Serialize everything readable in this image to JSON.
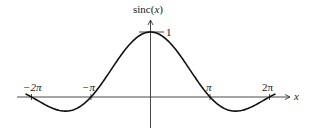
{
  "chart_data": {
    "type": "line",
    "title": "",
    "xlabel": "x",
    "ylabel": "sinc(x)",
    "function": "sin(x)/x",
    "xlim": [
      -6.8,
      6.8
    ],
    "ylim": [
      -0.45,
      1.2
    ],
    "grid": false,
    "legend": null,
    "x_ticks": [
      {
        "value": -6.2832,
        "label": "−2π"
      },
      {
        "value": -3.1416,
        "label": "−π"
      },
      {
        "value": 3.1416,
        "label": "π"
      },
      {
        "value": 6.2832,
        "label": "2π"
      }
    ],
    "y_ticks": [
      {
        "value": 1,
        "label": "1"
      }
    ],
    "series": [
      {
        "name": "sinc(x)",
        "x": [
          -6.6,
          -6.2832,
          -5.5,
          -4.4934,
          -3.5,
          -3.1416,
          -2.5,
          -2,
          -1.5,
          -1,
          -0.5,
          0,
          0.5,
          1,
          1.5,
          2,
          2.5,
          3.1416,
          3.5,
          4.4934,
          5.5,
          6.2832,
          6.6
        ],
        "values": [
          0.0474,
          0,
          -0.1282,
          -0.2172,
          -0.1002,
          0,
          0.2394,
          0.4546,
          0.665,
          0.8415,
          0.9589,
          1,
          0.9589,
          0.8415,
          0.665,
          0.4546,
          0.2394,
          0,
          -0.1002,
          -0.2172,
          -0.1282,
          0,
          0.0474
        ]
      }
    ]
  },
  "labels": {
    "y_axis": "sinc(x)",
    "x_axis": "x",
    "tick_neg2pi": "−2π",
    "tick_negpi": "−π",
    "tick_pi": "π",
    "tick_2pi": "2π",
    "tick_one": "1"
  }
}
